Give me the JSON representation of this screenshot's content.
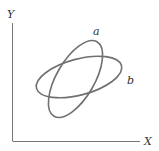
{
  "diagram": {
    "axes": {
      "x_label": "X",
      "y_label": "Y"
    },
    "ellipses": [
      {
        "label": "a",
        "orientation": "steep"
      },
      {
        "label": "b",
        "orientation": "shallow"
      }
    ],
    "colors": {
      "axis": "#777777",
      "ellipse": "#707070",
      "text": "#333333"
    }
  }
}
